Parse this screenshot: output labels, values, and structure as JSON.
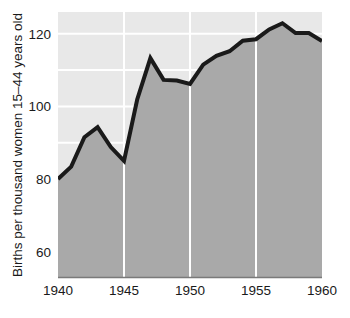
{
  "chart_data": {
    "type": "area",
    "title": "",
    "xlabel": "",
    "ylabel": "Births per thousand women 15–44 years old",
    "x": [
      1940,
      1941,
      1942,
      1943,
      1944,
      1945,
      1946,
      1947,
      1948,
      1949,
      1950,
      1951,
      1952,
      1953,
      1954,
      1955,
      1956,
      1957,
      1958,
      1959,
      1960
    ],
    "values": [
      80.0,
      83.4,
      91.5,
      94.3,
      88.8,
      85.0,
      101.9,
      113.3,
      107.3,
      107.1,
      106.2,
      111.5,
      113.9,
      115.2,
      118.1,
      118.5,
      121.2,
      122.9,
      120.2,
      120.2,
      118.0
    ],
    "series": [
      {
        "name": "Births per thousand women 15–44 years old",
        "values": [
          80.0,
          83.4,
          91.5,
          94.3,
          88.8,
          85.0,
          101.9,
          113.3,
          107.3,
          107.1,
          106.2,
          111.5,
          113.9,
          115.2,
          118.1,
          118.5,
          121.2,
          122.9,
          120.2,
          120.2,
          118.0
        ]
      }
    ],
    "xlim": [
      1940,
      1960
    ],
    "ylim": [
      53,
      126
    ],
    "x_tick_labels": [
      "1940",
      "1945",
      "1950",
      "1955",
      "1960"
    ],
    "x_ticks": [
      1940,
      1945,
      1950,
      1955,
      1960
    ],
    "y_tick_labels": [
      "60",
      "80",
      "100",
      "120"
    ],
    "y_ticks": [
      60,
      80,
      100,
      120
    ],
    "y_minor_gridlines": [
      60,
      70,
      80,
      90,
      100,
      110,
      120
    ],
    "grid": true,
    "grid_color": "#ffffff",
    "legend": "none",
    "colors": {
      "line": "#1a1a1a",
      "fill": "#a9a9a9",
      "plot_background": "#e8e8e8",
      "page_background": "#ffffff",
      "text": "#1a1a1a",
      "axis": "#7a7a7a"
    },
    "line_width": 4
  },
  "axes": {
    "y_axis_title": "Births per thousand women 15–44 years old",
    "x_tick_1940": "1940",
    "x_tick_1945": "1945",
    "x_tick_1950": "1950",
    "x_tick_1955": "1955",
    "x_tick_1960": "1960",
    "y_tick_60": "60",
    "y_tick_80": "80",
    "y_tick_100": "100",
    "y_tick_120": "120"
  }
}
